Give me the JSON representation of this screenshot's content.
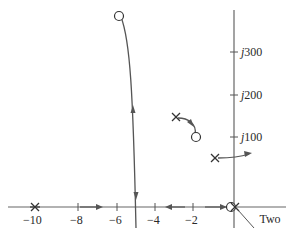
{
  "diagram": {
    "type": "root-locus",
    "real_axis": {
      "tick_labels": [
        "−10",
        "−8",
        "−6",
        "−4",
        "−2"
      ],
      "tick_values": [
        -10,
        -8,
        -6,
        -4,
        -2
      ]
    },
    "imag_axis": {
      "tick_labels": [
        {
          "j": "j",
          "num": "100"
        },
        {
          "j": "j",
          "num": "200"
        },
        {
          "j": "j",
          "num": "300"
        }
      ],
      "tick_values": [
        100,
        200,
        300
      ]
    },
    "annotation": {
      "line1": "Two",
      "line2": "poles"
    },
    "colors": {
      "axis": "#555555",
      "locus": "#555555",
      "text": "#2a2a2a"
    }
  }
}
